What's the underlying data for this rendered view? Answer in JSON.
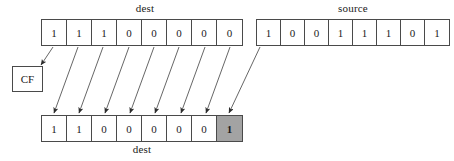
{
  "diagram": {
    "title_top_label": "dest",
    "source_label": "source",
    "bottom_label": "dest",
    "flag_label": "CF",
    "colors": {
      "stroke": "#4a4a4a",
      "shaded_cell": "#a3a3a3",
      "text": "#1a1a1a",
      "background": "#ffffff"
    },
    "dest_before": {
      "name": "dest",
      "bits": [
        "1",
        "1",
        "1",
        "0",
        "0",
        "0",
        "0",
        "0"
      ]
    },
    "source": {
      "name": "source",
      "bits": [
        "1",
        "0",
        "0",
        "1",
        "1",
        "1",
        "0",
        "1"
      ]
    },
    "dest_after": {
      "name": "dest",
      "bits": [
        "1",
        "1",
        "0",
        "0",
        "0",
        "0",
        "0",
        "1"
      ],
      "highlighted_index": 7
    },
    "carry_flag": {
      "name": "CF"
    }
  }
}
